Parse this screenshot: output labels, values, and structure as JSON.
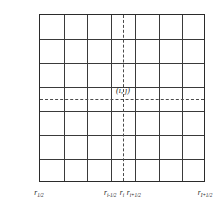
{
  "figure": {
    "type": "grid-diagram",
    "grid": {
      "columns": 7,
      "rows": 7,
      "border_color": "#2b2b2b",
      "line_color": "#3a3a3a",
      "background": "#ffffff"
    },
    "dashed_lines": {
      "color": "#4a4a4a",
      "vertical_at_fraction": 0.5,
      "horizontal_at_fraction": 0.5
    },
    "cell_annotation": {
      "text": "(i, j)",
      "base": "(i,",
      "second": "j)"
    },
    "y_axis": {
      "name": "Z",
      "labels": [
        {
          "base": "Z",
          "sub": "J+1/2",
          "pos": 0.0
        },
        {
          "base": "Z",
          "sub": "j+1/2",
          "pos": 0.4286
        },
        {
          "base": "Z",
          "sub": "j",
          "pos": 0.5
        },
        {
          "base": "Z",
          "sub": "j-1/2",
          "pos": 0.5714
        },
        {
          "base": "Z",
          "sub": "1/2",
          "pos": 1.0
        }
      ]
    },
    "x_axis": {
      "name": "r",
      "labels": [
        {
          "base": "r",
          "sub": "1/2",
          "pos": 0.0
        },
        {
          "base": "r",
          "sub": "i-1/2",
          "pos": 0.4286
        },
        {
          "base": "r",
          "sub": "i",
          "pos": 0.5
        },
        {
          "base": "r",
          "sub": "i+1/2",
          "pos": 0.5714
        },
        {
          "base": "r",
          "sub": "I+1/2",
          "pos": 1.0
        }
      ]
    }
  }
}
